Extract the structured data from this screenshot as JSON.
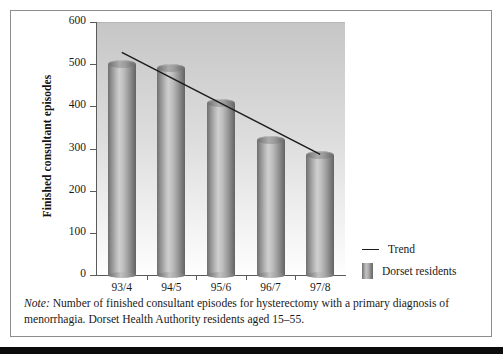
{
  "figure": {
    "note_label": "Note:",
    "note_text": " Number of finished consultant episodes for hysterectomy with a primary diagnosis of menorrhagia. Dorset Health Authority residents aged 15–55."
  },
  "legend": {
    "position": "right-bottom",
    "entries": [
      {
        "label": "Trend",
        "marker": "line",
        "color": "#1c1c1c"
      },
      {
        "label": "Dorset residents",
        "marker": "bar",
        "color": "#999999"
      }
    ]
  },
  "chart_data": {
    "type": "bar",
    "title": "",
    "subtitle": "",
    "xlabel": "",
    "ylabel": "Finished consultant episodes",
    "categories": [
      "93/4",
      "94/5",
      "95/6",
      "96/7",
      "97/8"
    ],
    "series": [
      {
        "name": "Dorset residents",
        "type": "bar",
        "values": [
          500,
          490,
          408,
          320,
          285
        ]
      },
      {
        "name": "Trend",
        "type": "line",
        "values": [
          528,
          467,
          407,
          346,
          286
        ]
      }
    ],
    "ylim": [
      0,
      600
    ],
    "yticks": [
      0,
      100,
      200,
      300,
      400,
      500,
      600
    ],
    "ytick_labels": [
      "0",
      "100",
      "200",
      "300",
      "400",
      "500",
      "600"
    ],
    "grid": false,
    "legend_position": "right",
    "plot_background": "#d4d4d4",
    "bar_color": "#969696",
    "trend_color": "#1c1c1c"
  }
}
